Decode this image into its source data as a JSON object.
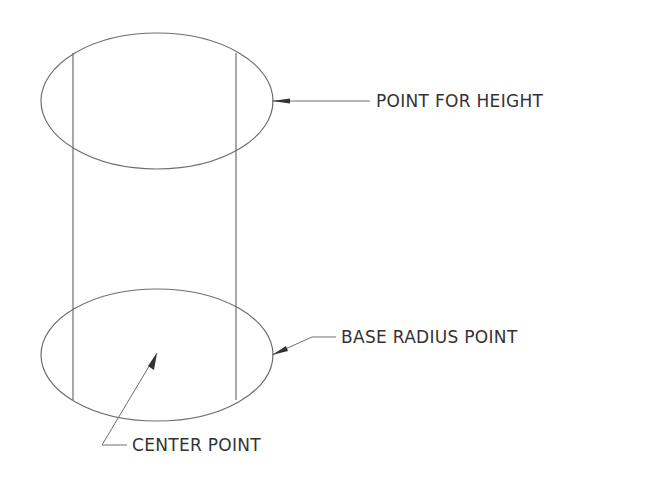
{
  "diagram": {
    "type": "cylinder-construction",
    "labels": {
      "top": "POINT FOR HEIGHT",
      "base_radius": "BASE RADIUS POINT",
      "center": "CENTER POINT"
    },
    "colors": {
      "line": "#6e6e6e",
      "text": "#333333",
      "background": "#ffffff"
    }
  }
}
